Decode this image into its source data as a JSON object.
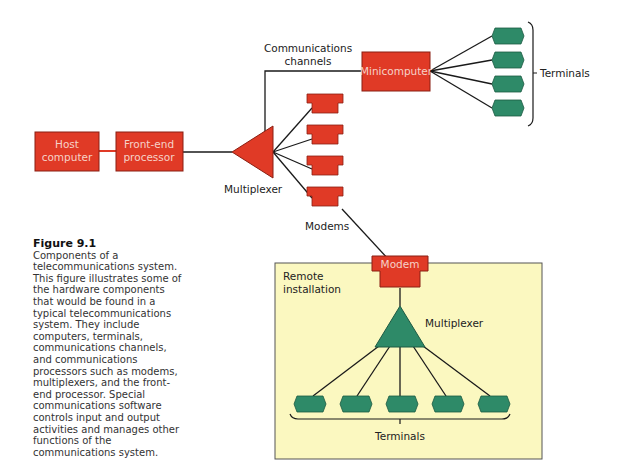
{
  "figure": {
    "number_label": "Figure 9.1",
    "caption": "Components of a telecommunications system. This figure illustrates some of the hardware components that would be found in a typical telecommunications system. They include computers, terminals, communications channels, and communications processors such as modems, multiplexers, and the front-end processor. Special communications software controls input and output activities and manages other functions of the communications system."
  },
  "diagram": {
    "host_computer": [
      "Host",
      "computer"
    ],
    "front_end_processor": [
      "Front-end",
      "processor"
    ],
    "multiplexer_label": "Multiplexer",
    "modems_label": "Modems",
    "communications_channels": [
      "Communications",
      "channels"
    ],
    "minicomputer": "Minicomputer",
    "terminals_top_label": "Terminals",
    "remote_installation": [
      "Remote",
      "installation"
    ],
    "remote_modem": "Modem",
    "remote_multiplexer_label": "Multiplexer",
    "terminals_bottom_label": "Terminals"
  },
  "colors": {
    "red_component": "#e03a26",
    "green_component": "#2e8a68",
    "remote_background": "#fbf8c0",
    "line": "#1a1a1a"
  }
}
